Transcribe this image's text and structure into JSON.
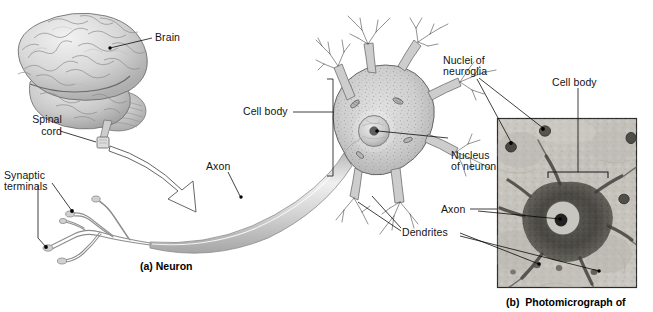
{
  "figure": {
    "bullet": "●",
    "number": "Figure 4-15",
    "title": "Neural Tissue"
  },
  "panel_a": {
    "caption": "(a) Neuron",
    "labels": {
      "brain": "Brain",
      "spinal_cord_line1": "Spinal",
      "spinal_cord_line2": "cord",
      "synaptic_line1": "Synaptic",
      "synaptic_line2": "terminals",
      "axon": "Axon",
      "cell_body": "Cell body",
      "nucleus_line1": "Nucleus",
      "nucleus_line2": "of neuron",
      "dendrites": "Dendrites"
    }
  },
  "panel_b": {
    "caption": "(b)  Photomicrograph of",
    "labels": {
      "nuclei_line1": "Nuclei of",
      "nuclei_line2": "neuroglia",
      "cell_body": "Cell body",
      "axon": "Axon",
      "dendrites": "Dendrites"
    }
  },
  "colors": {
    "background": "#ffffff",
    "ink": "#141414",
    "leader": "#000000",
    "brain_light": "#e8e8e8",
    "brain_mid": "#c4c4c4",
    "brain_dark": "#9a9a9a",
    "neuron_fill": "#d2d2d2",
    "neuron_stroke": "#5a5a5a",
    "axon_fill": "#cfcfcf",
    "micrograph_bg": "#c9c6c0",
    "micrograph_cell": "#4a4844",
    "micrograph_frame": "#2a2a2a"
  }
}
